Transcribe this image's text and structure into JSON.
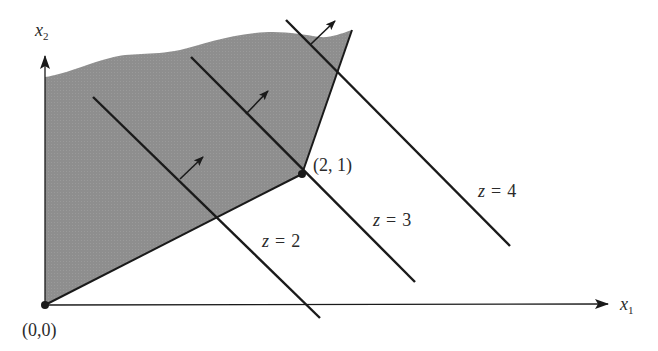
{
  "figure": {
    "type": "linear-programming-graphical-solution",
    "colors": {
      "feasible_region": "#8c8c8c",
      "lines": "#1a1a1a",
      "text": "#2a2a2a",
      "background": "#ffffff"
    },
    "axes": {
      "x_label": "x",
      "x_subscript": "1",
      "y_label": "x",
      "y_subscript": "2"
    },
    "points": [
      {
        "label": "(0,0)",
        "x": 0,
        "y": 0
      },
      {
        "label": "(2, 1)",
        "x": 2,
        "y": 1
      }
    ],
    "objective_lines": [
      {
        "label": "z = 2",
        "var": "z",
        "eq": "=",
        "value": "2"
      },
      {
        "label": "z = 3",
        "var": "z",
        "eq": "=",
        "value": "3"
      },
      {
        "label": "z = 4",
        "var": "z",
        "eq": "=",
        "value": "4"
      }
    ],
    "feasible_region": {
      "shaded": true,
      "unbounded_above": true
    }
  }
}
